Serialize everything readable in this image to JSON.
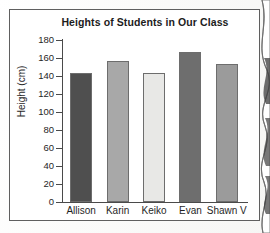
{
  "figure": {
    "title": "Heights of Students in Our Class",
    "y_axis_title": "Height (cm)"
  },
  "chart_data": {
    "type": "bar",
    "title": "Heights of Students in Our Class",
    "xlabel": "",
    "ylabel": "Height (cm)",
    "ylim": [
      0,
      180
    ],
    "ytick_labels": [
      "0",
      "20",
      "40",
      "60",
      "80",
      "100",
      "120",
      "140",
      "160",
      "180"
    ],
    "yticks": [
      0,
      20,
      40,
      60,
      80,
      100,
      120,
      140,
      160,
      180
    ],
    "grid": false,
    "legend": "none",
    "categories": [
      "Allison",
      "Karin",
      "Keiko",
      "Evan",
      "Shawn V"
    ],
    "values": [
      143,
      157,
      143,
      167,
      153
    ],
    "bar_colors": [
      "#4f4f4f",
      "#a8a8a8",
      "#e8e8e6",
      "#6e6e6e",
      "#9b9b9b"
    ]
  }
}
